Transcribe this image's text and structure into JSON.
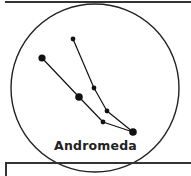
{
  "diagram": {
    "title": "Andromeda",
    "type": "constellation",
    "stars": [
      {
        "id": "a",
        "x": 42,
        "y": 58,
        "r": 3.6
      },
      {
        "id": "b",
        "x": 73,
        "y": 39,
        "r": 2.4
      },
      {
        "id": "c",
        "x": 94,
        "y": 88,
        "r": 2.4
      },
      {
        "id": "d",
        "x": 79,
        "y": 97,
        "r": 3.8
      },
      {
        "id": "e",
        "x": 107,
        "y": 111,
        "r": 2.4
      },
      {
        "id": "f",
        "x": 103,
        "y": 122,
        "r": 2.4
      },
      {
        "id": "g",
        "x": 133,
        "y": 132,
        "r": 3.8
      }
    ],
    "lines": [
      [
        "a",
        "d"
      ],
      [
        "d",
        "f"
      ],
      [
        "f",
        "g"
      ],
      [
        "b",
        "c"
      ],
      [
        "c",
        "e"
      ],
      [
        "e",
        "g"
      ]
    ],
    "colors": {
      "ink": "#111111",
      "background": "#ffffff"
    }
  }
}
